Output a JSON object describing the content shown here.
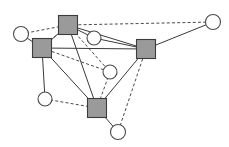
{
  "figure": {
    "name": "network-graph",
    "type": "node-link-diagram",
    "width": 229,
    "height": 147,
    "background": "#ffffff"
  },
  "style": {
    "square_fill": "#9a9a9a",
    "square_stroke": "#3c3c3c",
    "circle_fill": "#ffffff",
    "circle_stroke": "#4a4a4a",
    "edge_solid_color": "#3a3a3a",
    "edge_dashed_color": "#4a4a4a",
    "edge_width": 1,
    "dash_pattern": "3,2.2"
  },
  "chart_data": {
    "type": "scatter",
    "title": "",
    "xlabel": "",
    "ylabel": "",
    "grid": false,
    "legend": "none",
    "xlim": [
      0,
      229
    ],
    "ylim": [
      0,
      147
    ],
    "nodes": [
      {
        "id": "s1",
        "label": "",
        "shape": "square",
        "x": 68,
        "y": 25,
        "size": 19,
        "fill": "#9a9a9a"
      },
      {
        "id": "s2",
        "label": "",
        "shape": "square",
        "x": 42,
        "y": 48,
        "size": 19,
        "fill": "#9a9a9a"
      },
      {
        "id": "s3",
        "label": "",
        "shape": "square",
        "x": 146,
        "y": 49,
        "size": 19,
        "fill": "#9a9a9a"
      },
      {
        "id": "s4",
        "label": "",
        "shape": "square",
        "x": 97,
        "y": 108,
        "size": 19,
        "fill": "#9a9a9a"
      },
      {
        "id": "c1",
        "label": "",
        "shape": "circle",
        "x": 21,
        "y": 34,
        "size": 15,
        "fill": "#ffffff"
      },
      {
        "id": "c2",
        "label": "",
        "shape": "circle",
        "x": 213,
        "y": 22,
        "size": 15,
        "fill": "#ffffff"
      },
      {
        "id": "c3",
        "label": "",
        "shape": "circle",
        "x": 94,
        "y": 38,
        "size": 14,
        "fill": "#ffffff"
      },
      {
        "id": "c4",
        "label": "",
        "shape": "circle",
        "x": 110,
        "y": 72,
        "size": 14,
        "fill": "#ffffff"
      },
      {
        "id": "c5",
        "label": "",
        "shape": "circle",
        "x": 45,
        "y": 99,
        "size": 14,
        "fill": "#ffffff"
      },
      {
        "id": "c6",
        "label": "",
        "shape": "circle",
        "x": 118,
        "y": 132,
        "size": 15,
        "fill": "#ffffff"
      }
    ],
    "edges": [
      {
        "source": "c1",
        "target": "s1",
        "style": "dashed"
      },
      {
        "source": "s1",
        "target": "c2",
        "style": "dashed"
      },
      {
        "source": "c1",
        "target": "s2",
        "style": "solid"
      },
      {
        "source": "s1",
        "target": "s2",
        "style": "solid"
      },
      {
        "source": "s1",
        "target": "c3",
        "style": "solid"
      },
      {
        "source": "s1",
        "target": "s3",
        "style": "solid"
      },
      {
        "source": "s1",
        "target": "s4",
        "style": "solid"
      },
      {
        "source": "s1",
        "target": "c4",
        "style": "dashed"
      },
      {
        "source": "s1",
        "target": "s2",
        "style": "dashed"
      },
      {
        "source": "c3",
        "target": "s3",
        "style": "solid"
      },
      {
        "source": "s2",
        "target": "s3",
        "style": "solid"
      },
      {
        "source": "s2",
        "target": "c5",
        "style": "solid"
      },
      {
        "source": "s2",
        "target": "s4",
        "style": "solid"
      },
      {
        "source": "s2",
        "target": "c4",
        "style": "dashed"
      },
      {
        "source": "s3",
        "target": "c2",
        "style": "solid"
      },
      {
        "source": "s3",
        "target": "s4",
        "style": "solid"
      },
      {
        "source": "s3",
        "target": "c6",
        "style": "dashed"
      },
      {
        "source": "c4",
        "target": "s4",
        "style": "dashed"
      },
      {
        "source": "c5",
        "target": "s4",
        "style": "dashed"
      },
      {
        "source": "s4",
        "target": "c6",
        "style": "solid"
      }
    ]
  }
}
